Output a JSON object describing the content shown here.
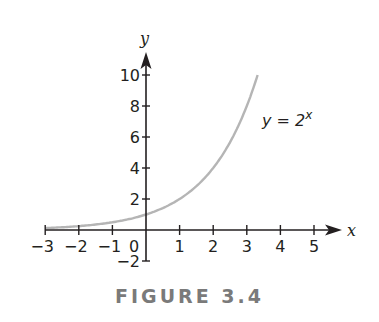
{
  "caption": "FIGURE 3.4",
  "chart_data": {
    "type": "line",
    "title": "",
    "caption": "FIGURE 3.4",
    "xlabel": "x",
    "ylabel": "y",
    "xlim": [
      -3,
      5
    ],
    "ylim": [
      -2,
      10
    ],
    "xticks": [
      -3,
      -2,
      -1,
      0,
      1,
      2,
      3,
      4,
      5
    ],
    "xtick_labels": [
      "−3",
      "−2",
      "−1",
      "0",
      "1",
      "2",
      "3",
      "4",
      "5"
    ],
    "yticks": [
      -2,
      2,
      4,
      6,
      8,
      10
    ],
    "ytick_labels": [
      "−2",
      "2",
      "4",
      "6",
      "8",
      "10"
    ],
    "grid": false,
    "legend": null,
    "annotations": [
      {
        "text": "y = 2^x",
        "x": 3.6,
        "y": 7
      }
    ],
    "series": [
      {
        "name": "y = 2^x",
        "function": "2^x",
        "color": "#b5b5b5",
        "x": [
          -3,
          -2,
          -1,
          0,
          1,
          2,
          3,
          3.32
        ],
        "y": [
          0.125,
          0.25,
          0.5,
          1,
          2,
          4,
          8,
          10
        ]
      }
    ]
  },
  "labels": {
    "x_axis": "x",
    "y_axis": "y",
    "fn_base": "y = 2",
    "fn_exp": "x",
    "zero": "0"
  },
  "colors": {
    "axis": "#231f20",
    "curve": "#b5b5b5",
    "caption": "#7a7a7a"
  }
}
